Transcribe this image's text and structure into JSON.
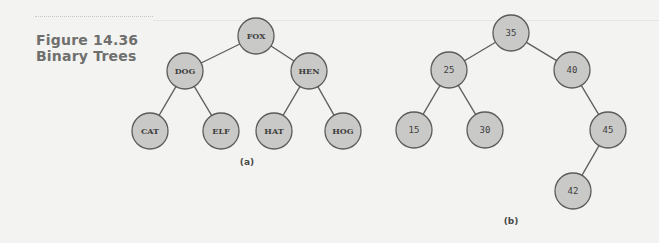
{
  "figure": {
    "number": "Figure 14.36",
    "title": "Binary Trees"
  },
  "trees": [
    {
      "id": "a",
      "label": "(a)",
      "label_pos": {
        "x": 247,
        "y": 157
      },
      "label_style": "serif",
      "nodes": [
        {
          "key": "FOX",
          "x": 256,
          "y": 36
        },
        {
          "key": "DOG",
          "x": 185,
          "y": 71
        },
        {
          "key": "HEN",
          "x": 309,
          "y": 71
        },
        {
          "key": "CAT",
          "x": 150,
          "y": 131
        },
        {
          "key": "ELF",
          "x": 221,
          "y": 131
        },
        {
          "key": "HAT",
          "x": 274,
          "y": 131
        },
        {
          "key": "HOG",
          "x": 343,
          "y": 131
        }
      ],
      "edges": [
        [
          "FOX",
          "DOG"
        ],
        [
          "FOX",
          "HEN"
        ],
        [
          "DOG",
          "CAT"
        ],
        [
          "DOG",
          "ELF"
        ],
        [
          "HEN",
          "HAT"
        ],
        [
          "HEN",
          "HOG"
        ]
      ]
    },
    {
      "id": "b",
      "label": "(b)",
      "label_pos": {
        "x": 511,
        "y": 216
      },
      "label_style": "mono",
      "nodes": [
        {
          "key": "35",
          "x": 511,
          "y": 33
        },
        {
          "key": "25",
          "x": 449,
          "y": 70
        },
        {
          "key": "40",
          "x": 572,
          "y": 70
        },
        {
          "key": "15",
          "x": 414,
          "y": 130
        },
        {
          "key": "30",
          "x": 485,
          "y": 130
        },
        {
          "key": "45",
          "x": 608,
          "y": 130
        },
        {
          "key": "42",
          "x": 573,
          "y": 191
        }
      ],
      "edges": [
        [
          "35",
          "25"
        ],
        [
          "35",
          "40"
        ],
        [
          "25",
          "15"
        ],
        [
          "25",
          "30"
        ],
        [
          "40",
          "45"
        ],
        [
          "45",
          "42"
        ]
      ]
    }
  ],
  "style": {
    "node_radius": 18,
    "node_fill": "#c9c9c7",
    "node_stroke": "#5b5b59",
    "edge_color": "#5d5d5b",
    "background": "#f3f3f1"
  }
}
